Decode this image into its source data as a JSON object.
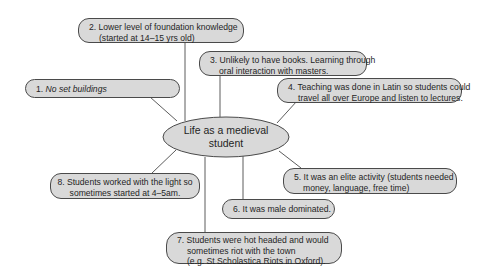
{
  "diagram": {
    "type": "mind-map",
    "center": {
      "lines": [
        "Life as a medieval",
        "student"
      ]
    },
    "colors": {
      "node_fill": "#d9d9d9",
      "node_border": "#4a4a4a",
      "connector": "#4a4a4a",
      "background": "#ffffff"
    },
    "nodes": [
      {
        "id": 1,
        "lines": [
          "1. No set buildings"
        ],
        "italic_part": "No set buildings"
      },
      {
        "id": 2,
        "lines": [
          "2. Lower level of foundation knowledge",
          "(started at 14–15 yrs old)"
        ]
      },
      {
        "id": 3,
        "lines": [
          "3. Unlikely to have books. Learning through",
          "oral interaction with masters."
        ]
      },
      {
        "id": 4,
        "lines": [
          "4. Teaching was done in Latin so students could",
          "travel all over Europe and listen to lectures."
        ]
      },
      {
        "id": 5,
        "lines": [
          "5. It was an elite activity (students needed",
          "money, language, free time)"
        ]
      },
      {
        "id": 6,
        "lines": [
          "6. It was male dominated."
        ]
      },
      {
        "id": 7,
        "lines": [
          "7. Students were hot headed and would",
          "sometimes riot with the town",
          "(e.g. St Scholastica Riots in Oxford)."
        ]
      },
      {
        "id": 8,
        "lines": [
          "8. Students worked with the light so",
          "sometimes started at 4–5am."
        ]
      }
    ],
    "node1_prefix": "1. "
  }
}
